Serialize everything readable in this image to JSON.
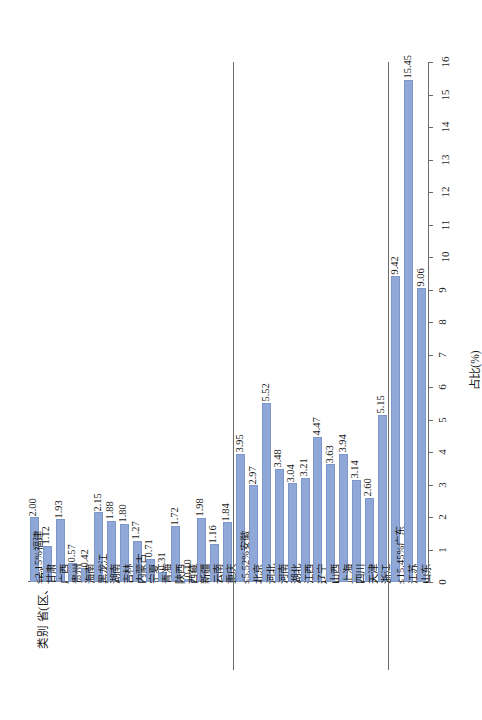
{
  "chart_data": {
    "type": "bar",
    "title": "",
    "xlabel": "类别 省(区、市)",
    "ylabel": "占比(%)",
    "ylim": [
      0,
      16
    ],
    "yticks": [
      0,
      1,
      2,
      3,
      4,
      5,
      6,
      7,
      8,
      9,
      10,
      11,
      12,
      13,
      14,
      15,
      16
    ],
    "grid": false,
    "legend": "none",
    "orientation": "vertical-bars-rotated-page",
    "bar_color": "#8fa8d7",
    "bar_edge_color": "#7d97cb",
    "axis_color": "#6a6a6a",
    "groups": [
      {
        "group_label": "≤2.15%",
        "categories": [
          "福建",
          "甘肃",
          "广西",
          "贵州",
          "海南",
          "黑龙江",
          "湖南",
          "吉林",
          "内蒙古",
          "宁夏",
          "青海",
          "陕西",
          "西藏",
          "新疆",
          "云南",
          "重庆"
        ],
        "values": [
          2.0,
          1.12,
          1.93,
          0.57,
          0.42,
          2.15,
          1.88,
          1.8,
          1.27,
          0.71,
          0.31,
          1.72,
          0.1,
          1.98,
          1.16,
          1.84
        ],
        "labels": [
          "2.00",
          "1.12",
          "1.93",
          "0.57",
          "0.42",
          "2.15",
          "1.88",
          "1.80",
          "1.27",
          "0.71",
          "0.31",
          "1.72",
          "0.10",
          "1.98",
          "1.16",
          "1.84"
        ]
      },
      {
        "group_label": "≤5.52%",
        "categories": [
          "安徽",
          "北京",
          "河北",
          "河南",
          "湖北",
          "江西",
          "辽宁",
          "山西",
          "上海",
          "四川",
          "天津",
          "浙江"
        ],
        "values": [
          3.95,
          2.97,
          5.52,
          3.48,
          3.04,
          3.21,
          4.47,
          3.63,
          3.94,
          3.14,
          2.6,
          5.15
        ],
        "labels": [
          "3.95",
          "2.97",
          "5.52",
          "3.48",
          "3.04",
          "3.21",
          "4.47",
          "3.63",
          "3.94",
          "3.14",
          "2.60",
          "5.15"
        ]
      },
      {
        "group_label": "≤15.45%",
        "categories": [
          "广东",
          "江苏",
          "山东"
        ],
        "values": [
          9.42,
          15.45,
          9.06
        ],
        "labels": [
          "9.42",
          "15.45",
          "9.06"
        ]
      }
    ]
  },
  "axes": {
    "category_axis_title": "类别 省(区、市)",
    "value_axis_title": "占比(%)",
    "value_tick_labels": [
      "0",
      "1",
      "2",
      "3",
      "4",
      "5",
      "6",
      "7",
      "8",
      "9",
      "10",
      "11",
      "12",
      "13",
      "14",
      "15",
      "16"
    ]
  }
}
